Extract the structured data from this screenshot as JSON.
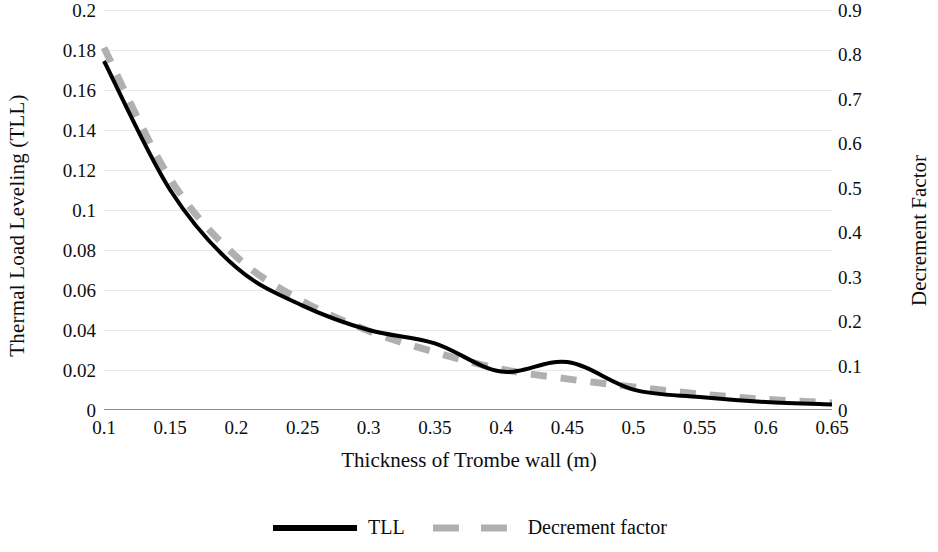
{
  "chart_data": {
    "type": "line",
    "title": "",
    "xlabel": "Thickness of Trombe wall (m)",
    "ylabel": "Thermal Load Leveling (TLL)",
    "y2label": "Decrement Factor",
    "categories": [
      "0.1",
      "0.15",
      "0.2",
      "0.25",
      "0.3",
      "0.35",
      "0.4",
      "0.45",
      "0.5",
      "0.55",
      "0.6",
      "0.65"
    ],
    "x": [
      0.1,
      0.15,
      0.2,
      0.25,
      0.3,
      0.35,
      0.4,
      0.45,
      0.5,
      0.55,
      0.6,
      0.65
    ],
    "ylim": [
      0,
      0.2
    ],
    "y2lim": [
      0,
      0.9
    ],
    "yticks": [
      "0",
      "0.02",
      "0.04",
      "0.06",
      "0.08",
      "0.1",
      "0.12",
      "0.14",
      "0.16",
      "0.18",
      "0.2"
    ],
    "ytick_values": [
      0,
      0.02,
      0.04,
      0.06,
      0.08,
      0.1,
      0.12,
      0.14,
      0.16,
      0.18,
      0.2
    ],
    "y2ticks": [
      "0",
      "0.1",
      "0.2",
      "0.3",
      "0.4",
      "0.5",
      "0.6",
      "0.7",
      "0.8",
      "0.9"
    ],
    "y2tick_values": [
      0,
      0.1,
      0.2,
      0.3,
      0.4,
      0.5,
      0.6,
      0.7,
      0.8,
      0.9
    ],
    "grid": true,
    "grid_color": "#e8e8e8",
    "legend_position": "bottom-right",
    "smoothed": true,
    "series": [
      {
        "name": "TLL",
        "axis": "left",
        "color": "#000000",
        "style": "solid",
        "width": 4,
        "values": [
          0.1745,
          0.11,
          0.0712,
          0.0522,
          0.04,
          0.0333,
          0.0192,
          0.024,
          0.0102,
          0.0065,
          0.004,
          0.0028
        ]
      },
      {
        "name": "Decrement factor",
        "axis": "right",
        "color": "#b0b0b0",
        "style": "dashed",
        "width": 7,
        "values": [
          0.815,
          0.52,
          0.345,
          0.245,
          0.178,
          0.13,
          0.092,
          0.07,
          0.052,
          0.036,
          0.024,
          0.016
        ]
      }
    ]
  },
  "legend": {
    "items": [
      {
        "label": "TLL",
        "swatch": "solid-black-line"
      },
      {
        "label": "Decrement factor",
        "swatch": "dashed-gray-line"
      }
    ]
  }
}
